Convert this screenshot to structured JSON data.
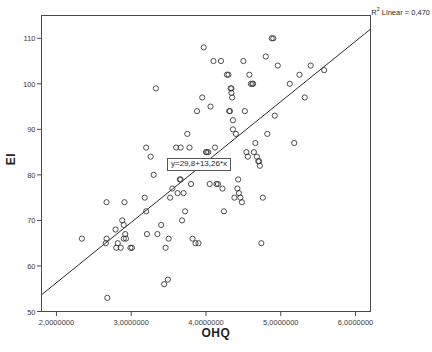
{
  "chart_data": {
    "type": "scatter",
    "title": "",
    "xlabel": "OHQ",
    "ylabel": "EI",
    "xlim": [
      1.8,
      6.2
    ],
    "ylim": [
      50,
      115
    ],
    "grid": false,
    "legend": null,
    "x_ticks": [
      2.0,
      3.0,
      4.0,
      5.0,
      6.0
    ],
    "x_tick_labels": [
      "2,0000000",
      "3,0000000",
      "4,0000000",
      "5,0000000",
      "6,0000000"
    ],
    "y_ticks": [
      50,
      60,
      70,
      80,
      90,
      100,
      110
    ],
    "y_tick_labels": [
      "50",
      "60",
      "70",
      "80",
      "90",
      "100",
      "110"
    ],
    "marker": "open-circle",
    "marker_color": "#3a3a3a",
    "fit_line": {
      "type": "linear",
      "equation_label": "y=29,8+13,26*x",
      "intercept": 29.8,
      "slope": 13.26,
      "r_squared_label": "R2 Linear = 0,470",
      "r_squared": 0.47,
      "x_start": 1.8,
      "x_end": 6.2,
      "y_start": 53.67,
      "y_end": 112.0,
      "color": "#2b2b2b"
    },
    "points": [
      [
        2.34,
        66
      ],
      [
        2.66,
        65
      ],
      [
        2.67,
        66
      ],
      [
        2.67,
        74
      ],
      [
        2.68,
        53
      ],
      [
        2.79,
        68
      ],
      [
        2.8,
        64
      ],
      [
        2.82,
        65
      ],
      [
        2.86,
        64
      ],
      [
        2.88,
        70
      ],
      [
        2.9,
        66
      ],
      [
        2.9,
        69
      ],
      [
        2.91,
        74
      ],
      [
        2.92,
        67
      ],
      [
        2.93,
        66
      ],
      [
        2.99,
        64
      ],
      [
        3.01,
        64
      ],
      [
        3.18,
        75
      ],
      [
        3.2,
        86
      ],
      [
        3.2,
        72
      ],
      [
        3.21,
        67
      ],
      [
        3.26,
        84
      ],
      [
        3.3,
        80
      ],
      [
        3.33,
        99
      ],
      [
        3.35,
        67
      ],
      [
        3.4,
        69
      ],
      [
        3.44,
        56
      ],
      [
        3.46,
        64
      ],
      [
        3.49,
        57
      ],
      [
        3.5,
        66
      ],
      [
        3.52,
        75
      ],
      [
        3.55,
        77
      ],
      [
        3.6,
        86
      ],
      [
        3.62,
        76
      ],
      [
        3.65,
        79
      ],
      [
        3.66,
        79
      ],
      [
        3.66,
        86
      ],
      [
        3.68,
        70
      ],
      [
        3.7,
        76
      ],
      [
        3.72,
        72
      ],
      [
        3.75,
        89
      ],
      [
        3.78,
        86
      ],
      [
        3.8,
        78
      ],
      [
        3.82,
        66
      ],
      [
        3.86,
        65
      ],
      [
        3.88,
        94
      ],
      [
        3.9,
        65
      ],
      [
        3.95,
        97
      ],
      [
        3.97,
        108
      ],
      [
        4.0,
        85
      ],
      [
        4.01,
        85
      ],
      [
        4.03,
        85
      ],
      [
        4.05,
        78
      ],
      [
        4.06,
        95
      ],
      [
        4.1,
        105
      ],
      [
        4.12,
        86
      ],
      [
        4.14,
        78
      ],
      [
        4.16,
        78
      ],
      [
        4.2,
        105
      ],
      [
        4.22,
        77
      ],
      [
        4.24,
        72
      ],
      [
        4.28,
        102
      ],
      [
        4.3,
        102
      ],
      [
        4.31,
        94
      ],
      [
        4.32,
        94
      ],
      [
        4.33,
        99
      ],
      [
        4.34,
        99
      ],
      [
        4.34,
        98
      ],
      [
        4.35,
        97
      ],
      [
        4.36,
        92
      ],
      [
        4.36,
        90
      ],
      [
        4.38,
        75
      ],
      [
        4.4,
        89
      ],
      [
        4.42,
        77
      ],
      [
        4.43,
        79
      ],
      [
        4.44,
        76
      ],
      [
        4.46,
        75
      ],
      [
        4.48,
        74
      ],
      [
        4.5,
        105
      ],
      [
        4.52,
        94
      ],
      [
        4.54,
        85
      ],
      [
        4.56,
        84
      ],
      [
        4.58,
        102
      ],
      [
        4.6,
        100
      ],
      [
        4.62,
        100
      ],
      [
        4.63,
        100
      ],
      [
        4.64,
        85
      ],
      [
        4.66,
        87
      ],
      [
        4.68,
        84
      ],
      [
        4.7,
        83
      ],
      [
        4.71,
        83
      ],
      [
        4.72,
        82
      ],
      [
        4.74,
        65
      ],
      [
        4.76,
        75
      ],
      [
        4.8,
        106
      ],
      [
        4.82,
        89
      ],
      [
        4.88,
        110
      ],
      [
        4.9,
        110
      ],
      [
        4.92,
        93
      ],
      [
        4.96,
        104
      ],
      [
        5.12,
        100
      ],
      [
        5.18,
        87
      ],
      [
        5.25,
        102
      ],
      [
        5.32,
        97
      ],
      [
        5.4,
        104
      ],
      [
        5.58,
        103
      ]
    ]
  },
  "annotations": {
    "r2_prefix": "R",
    "r2_superscript": "2",
    "r2_text": " Linear = 0,470",
    "equation": "y=29,8+13,26*x"
  }
}
